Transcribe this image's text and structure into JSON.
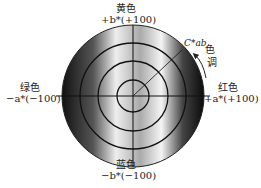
{
  "diagram": {
    "type": "CIELAB a*b* chromaticity diagram",
    "top": {
      "name": "黄色",
      "axis": "+b*(+100)"
    },
    "bottom": {
      "name": "蓝色",
      "axis": "−b*(−100)"
    },
    "left": {
      "name": "绿色",
      "axis": "−a*(−100)"
    },
    "right": {
      "name": "红色",
      "axis": "+a*(+100)"
    },
    "chroma_label": "C*ab",
    "hue_label_1": "色",
    "hue_label_2": "调",
    "rings": 4
  }
}
